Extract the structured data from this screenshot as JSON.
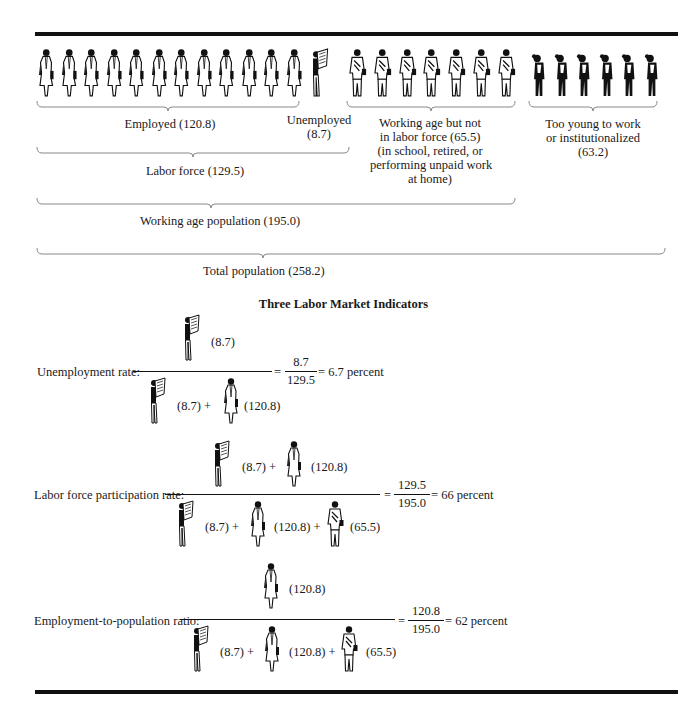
{
  "top_groups": {
    "employed": {
      "label": "Employed (120.8)",
      "figure_count": 12,
      "icon": "employed-woman-icon"
    },
    "unemployed": {
      "label_line1": "Unemployed",
      "label_line2": "(8.7)",
      "figure_count": 1,
      "icon": "unemployed-man-icon"
    },
    "not_in_labor_force": {
      "lines": [
        "Working age but not",
        "in labor force (65.5)",
        "(in school, retired, or",
        "performing unpaid work",
        "at home)"
      ],
      "figure_count": 7,
      "icon": "not-in-labor-force-man-icon"
    },
    "too_young": {
      "lines": [
        "Too young to work",
        "or institutionalized",
        "(63.2)"
      ],
      "figure_count": 6,
      "icon": "too-young-child-icon"
    }
  },
  "aggregates": {
    "labor_force": "Labor force (129.5)",
    "working_age": "Working age population (195.0)",
    "total": "Total population (258.2)"
  },
  "indicators_title": "Three Labor Market Indicators",
  "indicators": [
    {
      "label": "Unemployment rate:",
      "numerator": [
        {
          "icon": "unemployed-man-icon",
          "value": "(8.7)"
        }
      ],
      "denominator": [
        {
          "icon": "unemployed-man-icon",
          "value": "(8.7) +"
        },
        {
          "icon": "employed-woman-icon",
          "value": "(120.8)"
        }
      ],
      "frac_num": "8.7",
      "frac_den": "129.5",
      "result": "= 6.7 percent",
      "eq": "="
    },
    {
      "label": "Labor force participation rate:",
      "numerator": [
        {
          "icon": "unemployed-man-icon",
          "value": "(8.7) +"
        },
        {
          "icon": "employed-woman-icon",
          "value": "(120.8)"
        }
      ],
      "denominator": [
        {
          "icon": "unemployed-man-icon",
          "value": "(8.7) +"
        },
        {
          "icon": "employed-woman-icon",
          "value": "(120.8) +"
        },
        {
          "icon": "not-in-labor-force-man-icon",
          "value": "(65.5)"
        }
      ],
      "frac_num": "129.5",
      "frac_den": "195.0",
      "result": "= 66 percent",
      "eq": "="
    },
    {
      "label": "Employment-to-population ratio:",
      "numerator": [
        {
          "icon": "employed-woman-icon",
          "value": "(120.8)"
        }
      ],
      "denominator": [
        {
          "icon": "unemployed-man-icon",
          "value": "(8.7) +"
        },
        {
          "icon": "employed-woman-icon",
          "value": "(120.8) +"
        },
        {
          "icon": "not-in-labor-force-man-icon",
          "value": "(65.5)"
        }
      ],
      "frac_num": "120.8",
      "frac_den": "195.0",
      "result": "= 62 percent",
      "eq": "="
    }
  ],
  "colors": {
    "ink": "#111111",
    "bracket": "#888888",
    "background": "#ffffff"
  }
}
